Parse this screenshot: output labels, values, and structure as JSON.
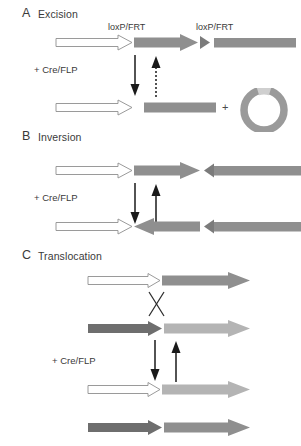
{
  "figure": {
    "title_implicit": "Site-specific recombination outcomes mediated by Cre/FLP",
    "width": 301,
    "height": 446,
    "background": "#ffffff"
  },
  "colors": {
    "white_segment": "#ffffff",
    "white_segment_outline": "#8a8a8a",
    "medium_gray": "#8f8f8f",
    "dark_gray": "#6e6e6e",
    "light_gray": "#b4b4b4",
    "arrow_black": "#1a1a1a",
    "text": "#3a3a3a",
    "circle_gray": "#9a9a9a"
  },
  "panels": [
    {
      "id": "A",
      "letter": "A",
      "title": "Excision",
      "enzyme_label": "+ Cre/FLP",
      "site_labels": [
        "loxP/FRT",
        "loxP/FRT"
      ],
      "plus_sign": "+",
      "reaction_arrows": {
        "forward": "solid-down-arrow",
        "reverse": "dotted-up-arrow"
      },
      "products": [
        "linear-recombined-dna",
        "excised-circular-dna"
      ]
    },
    {
      "id": "B",
      "letter": "B",
      "title": "Inversion",
      "enzyme_label": "+ Cre/FLP",
      "reaction_arrows": {
        "forward": "solid-down-arrow",
        "reverse": "solid-up-arrow"
      },
      "products": [
        "inverted-segment-dna"
      ]
    },
    {
      "id": "C",
      "letter": "C",
      "title": "Translocation",
      "enzyme_label": "+ Cre/FLP",
      "crossover_symbol": "X",
      "reaction_arrows": {
        "forward": "solid-down-arrow",
        "reverse": "solid-up-arrow"
      },
      "products": [
        "translocated-chromosome-1",
        "translocated-chromosome-2"
      ]
    }
  ]
}
